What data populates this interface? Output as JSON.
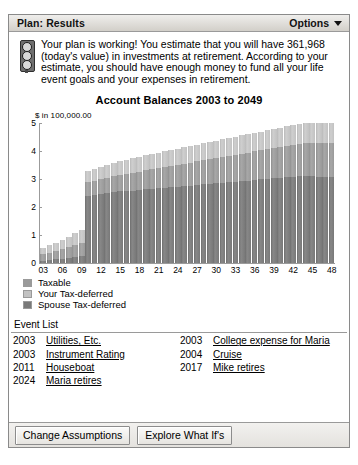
{
  "header": {
    "title": "Plan: Results",
    "options_label": "Options",
    "caret_icon": "chevron-down-icon"
  },
  "message": {
    "icon": "traffic-light-icon",
    "text": "Your plan is working! You estimate that you will have 361,968 (today's value) in investments at retirement. According to your estimate, you should have enough money to fund all your life event goals and your expenses in retirement.",
    "estimated_value": "361,968"
  },
  "chart_data": {
    "type": "bar",
    "title": "Account Balances 2003 to 2049",
    "ylabel": "$ in 100,000.00",
    "xlabel": "",
    "ylim": [
      0,
      5
    ],
    "yticks": [
      0,
      1,
      2,
      3,
      4,
      5
    ],
    "stacked": true,
    "grid": false,
    "legend_position": "below",
    "categories": [
      "03",
      "04",
      "05",
      "06",
      "07",
      "08",
      "09",
      "10",
      "11",
      "12",
      "13",
      "14",
      "15",
      "16",
      "17",
      "18",
      "19",
      "20",
      "21",
      "22",
      "23",
      "24",
      "25",
      "26",
      "27",
      "28",
      "29",
      "30",
      "31",
      "32",
      "33",
      "34",
      "35",
      "36",
      "37",
      "38",
      "39",
      "40",
      "41",
      "42",
      "43",
      "44",
      "45",
      "46",
      "47",
      "48"
    ],
    "xtick_labels": [
      "03",
      "06",
      "09",
      "12",
      "15",
      "18",
      "21",
      "24",
      "27",
      "30",
      "33",
      "36",
      "39",
      "42",
      "45",
      "48"
    ],
    "series": [
      {
        "name": "Spouse Tax-deferred",
        "color": "#797979",
        "values": [
          0.1,
          0.12,
          0.14,
          0.17,
          0.2,
          0.24,
          0.28,
          2.4,
          2.44,
          2.47,
          2.5,
          2.54,
          2.57,
          2.58,
          2.6,
          2.62,
          2.64,
          2.66,
          2.68,
          2.7,
          2.72,
          2.74,
          2.76,
          2.78,
          2.8,
          2.82,
          2.84,
          2.86,
          2.88,
          2.9,
          2.92,
          2.94,
          2.96,
          2.98,
          3.0,
          3.02,
          3.04,
          3.06,
          3.08,
          3.1,
          3.12,
          3.14,
          3.16,
          3.18,
          3.2,
          3.22
        ]
      },
      {
        "name": "Taxable",
        "color": "#9a9a9a",
        "values": [
          0.22,
          0.26,
          0.3,
          0.34,
          0.38,
          0.42,
          0.46,
          0.5,
          0.52,
          0.54,
          0.56,
          0.58,
          0.6,
          0.62,
          0.64,
          0.66,
          0.68,
          0.7,
          0.72,
          0.74,
          0.76,
          0.78,
          0.8,
          0.82,
          0.84,
          0.86,
          0.88,
          0.9,
          0.92,
          0.94,
          0.96,
          0.98,
          1.0,
          1.02,
          1.04,
          1.06,
          1.08,
          1.1,
          1.12,
          1.14,
          1.16,
          1.18,
          1.2,
          1.22,
          1.24,
          1.26
        ]
      },
      {
        "name": "Your Tax-deferred",
        "color": "#c2c2c2",
        "values": [
          0.23,
          0.26,
          0.29,
          0.33,
          0.37,
          0.41,
          0.45,
          0.4,
          0.42,
          0.44,
          0.46,
          0.47,
          0.48,
          0.5,
          0.52,
          0.53,
          0.54,
          0.55,
          0.56,
          0.57,
          0.58,
          0.58,
          0.59,
          0.6,
          0.6,
          0.61,
          0.62,
          0.62,
          0.63,
          0.64,
          0.64,
          0.65,
          0.66,
          0.66,
          0.67,
          0.68,
          0.68,
          0.69,
          0.7,
          0.7,
          0.71,
          0.72,
          0.72,
          0.73,
          0.74,
          0.75
        ]
      }
    ],
    "totals": [
      0.55,
      0.64,
      0.73,
      0.84,
      0.95,
      1.07,
      1.19,
      3.3,
      3.38,
      3.45,
      3.52,
      3.59,
      3.65,
      3.7,
      3.76,
      3.81,
      3.86,
      3.91,
      3.96,
      4.01,
      4.06,
      4.1,
      4.15,
      4.2,
      4.24,
      4.29,
      4.34,
      4.38,
      4.43,
      4.48,
      4.52,
      4.57,
      4.62,
      4.66,
      4.71,
      4.76,
      4.8,
      4.85,
      4.9,
      4.94,
      4.99,
      5.04,
      5.08,
      5.13,
      5.18,
      5.23
    ]
  },
  "legend": [
    {
      "label": "Taxable",
      "color": "#9a9a9a"
    },
    {
      "label": "Your Tax-deferred",
      "color": "#c2c2c2"
    },
    {
      "label": "Spouse Tax-deferred",
      "color": "#797979"
    }
  ],
  "event_list": {
    "title": "Event List",
    "left": [
      {
        "year": "2003",
        "name": "Utilities, Etc."
      },
      {
        "year": "2003",
        "name": "Instrument Rating"
      },
      {
        "year": "2011",
        "name": "Houseboat"
      },
      {
        "year": "2024",
        "name": "Maria retires"
      }
    ],
    "right": [
      {
        "year": "2003",
        "name": "College expense for Maria"
      },
      {
        "year": "2004",
        "name": "Cruise"
      },
      {
        "year": "2017",
        "name": "Mike retires"
      }
    ]
  },
  "buttons": {
    "change_assumptions": "Change Assumptions",
    "explore_what_ifs": "Explore What If's"
  }
}
